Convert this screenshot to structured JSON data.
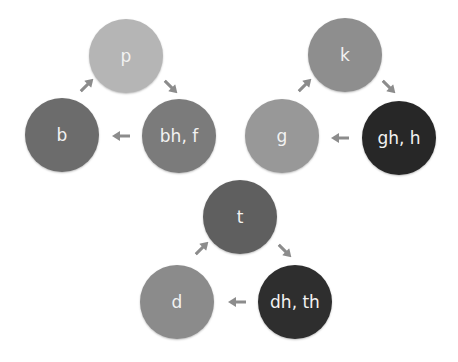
{
  "diagram": {
    "type": "cycle-diagrams",
    "cycles": [
      {
        "name": "labial",
        "nodes": [
          {
            "label": "p",
            "color": "#b5b5b5"
          },
          {
            "label": "bh, f",
            "color": "#7b7b7b"
          },
          {
            "label": "b",
            "color": "#6c6c6c"
          }
        ]
      },
      {
        "name": "velar",
        "nodes": [
          {
            "label": "k",
            "color": "#8e8e8e"
          },
          {
            "label": "gh, h",
            "color": "#272727"
          },
          {
            "label": "g",
            "color": "#989898"
          }
        ]
      },
      {
        "name": "dental",
        "nodes": [
          {
            "label": "t",
            "color": "#5f5f5f"
          },
          {
            "label": "dh, th",
            "color": "#2e2e2e"
          },
          {
            "label": "d",
            "color": "#8b8b8b"
          }
        ]
      }
    ],
    "arrow_color": "#8c8c8c"
  }
}
